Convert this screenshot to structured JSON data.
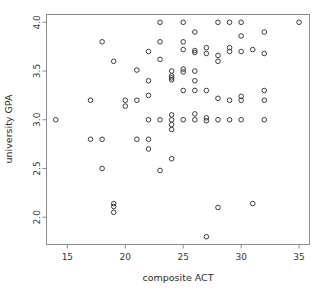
{
  "chart_data": {
    "type": "scatter",
    "title": "",
    "xlabel": "composite ACT",
    "ylabel": "university GPA",
    "xlim": [
      13.2,
      35.9
    ],
    "ylim": [
      1.72,
      4.08
    ],
    "xticks": [
      15,
      20,
      25,
      30,
      35
    ],
    "xtick_labels": [
      "15",
      "20",
      "25",
      "30",
      "35"
    ],
    "yticks": [
      2.0,
      2.5,
      3.0,
      3.5,
      4.0
    ],
    "ytick_labels": [
      "2.0",
      "2.5",
      "3.0",
      "3.5",
      "4.0"
    ],
    "grid": false,
    "legend": false,
    "marker": "open-circle",
    "marker_color": "#3c3c44",
    "frame_color": "#8c8c8c",
    "n_points": 119,
    "points": [
      [
        14,
        3.0
      ],
      [
        17,
        3.2
      ],
      [
        17,
        2.8
      ],
      [
        18,
        3.8
      ],
      [
        18,
        2.8
      ],
      [
        18,
        2.5
      ],
      [
        19,
        3.6
      ],
      [
        19,
        2.14
      ],
      [
        19,
        2.11
      ],
      [
        19,
        2.05
      ],
      [
        20,
        3.2
      ],
      [
        20,
        3.14
      ],
      [
        21,
        3.51
      ],
      [
        21,
        3.2
      ],
      [
        21,
        2.8
      ],
      [
        22,
        3.7
      ],
      [
        22,
        3.4
      ],
      [
        22,
        3.25
      ],
      [
        22,
        3.0
      ],
      [
        22,
        2.8
      ],
      [
        22,
        2.7
      ],
      [
        23,
        4.0
      ],
      [
        23,
        3.8
      ],
      [
        23,
        3.62
      ],
      [
        23,
        3.0
      ],
      [
        23,
        2.48
      ],
      [
        24,
        3.5
      ],
      [
        24,
        3.45
      ],
      [
        24,
        3.43
      ],
      [
        24,
        3.41
      ],
      [
        24,
        3.05
      ],
      [
        24,
        3.0
      ],
      [
        24,
        2.95
      ],
      [
        24,
        2.9
      ],
      [
        24,
        2.6
      ],
      [
        25,
        4.0
      ],
      [
        25,
        3.8
      ],
      [
        25,
        3.72
      ],
      [
        25,
        3.52
      ],
      [
        25,
        3.49
      ],
      [
        25,
        3.3
      ],
      [
        25,
        3.0
      ],
      [
        26,
        3.9
      ],
      [
        26,
        3.71
      ],
      [
        26,
        3.69
      ],
      [
        26,
        3.5
      ],
      [
        26,
        3.4
      ],
      [
        26,
        3.3
      ],
      [
        26,
        3.06
      ],
      [
        26,
        3.0
      ],
      [
        27,
        3.74
      ],
      [
        27,
        3.68
      ],
      [
        27,
        3.3
      ],
      [
        27,
        3.02
      ],
      [
        27,
        2.99
      ],
      [
        27,
        1.8
      ],
      [
        28,
        4.0
      ],
      [
        28,
        3.66
      ],
      [
        28,
        3.6
      ],
      [
        28,
        3.22
      ],
      [
        28,
        3.0
      ],
      [
        28,
        2.1
      ],
      [
        29,
        4.0
      ],
      [
        29,
        3.74
      ],
      [
        29,
        3.7
      ],
      [
        29,
        3.2
      ],
      [
        29,
        3.0
      ],
      [
        30,
        4.0
      ],
      [
        30,
        3.86
      ],
      [
        30,
        3.7
      ],
      [
        30,
        3.24
      ],
      [
        30,
        3.2
      ],
      [
        30,
        3.0
      ],
      [
        31,
        3.72
      ],
      [
        31,
        2.14
      ],
      [
        32,
        3.9
      ],
      [
        32,
        3.68
      ],
      [
        32,
        3.3
      ],
      [
        32,
        3.2
      ],
      [
        32,
        3.0
      ],
      [
        35,
        4.0
      ]
    ]
  },
  "axes": {
    "x_label": "composite ACT",
    "y_label": "university GPA"
  }
}
